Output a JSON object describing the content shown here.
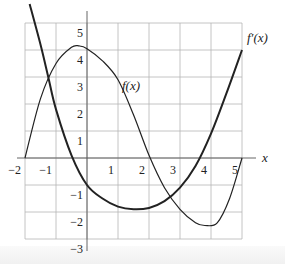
{
  "chart_data": {
    "type": "line",
    "title": "",
    "xlabel": "x",
    "ylabel": "",
    "xlim": [
      -2,
      5
    ],
    "ylim": [
      -3,
      5
    ],
    "grid": true,
    "x_ticks": [
      -2,
      -1,
      1,
      2,
      3,
      4,
      5
    ],
    "y_ticks": [
      5,
      4,
      3,
      2,
      1,
      -1,
      -2,
      -3
    ],
    "x_tick_labels": [
      "−2",
      "−1",
      "1",
      "2",
      "3",
      "4",
      "5"
    ],
    "y_tick_labels": [
      "5",
      "4",
      "3",
      "2",
      "1",
      "−1",
      "−2",
      "−3"
    ],
    "series": [
      {
        "name": "f(x)",
        "label": "f(x)",
        "stroke_width": 1.2,
        "x": [
          -2,
          -1.5,
          -1,
          -0.5,
          -0.25,
          0,
          0.5,
          1,
          1.5,
          2,
          2.5,
          3,
          3.5,
          3.8,
          4.2,
          4.6,
          5
        ],
        "y": [
          0,
          2.2,
          3.5,
          4.1,
          4.15,
          4.05,
          3.6,
          2.9,
          1.6,
          0.1,
          -1.1,
          -1.9,
          -2.4,
          -2.5,
          -2.4,
          -1.5,
          0
        ]
      },
      {
        "name": "f'(x)",
        "label": "f′(x)",
        "stroke_width": 2,
        "x": [
          -1.85,
          -1.5,
          -1.25,
          -1,
          -0.5,
          0,
          0.5,
          1,
          1.5,
          2,
          2.5,
          3,
          3.5,
          4,
          4.5,
          5
        ],
        "y": [
          5.7,
          4.2,
          3,
          1.8,
          0.1,
          -1,
          -1.5,
          -1.8,
          -1.9,
          -1.85,
          -1.6,
          -1.1,
          -0.3,
          0.9,
          2.4,
          4
        ]
      }
    ]
  },
  "labels": {
    "x_axis": "x",
    "f": "f(x)",
    "fprime": "f′(x)"
  },
  "colors": {
    "curve": "#222222",
    "grid": "#b5b5b5",
    "axis": "#555555"
  }
}
